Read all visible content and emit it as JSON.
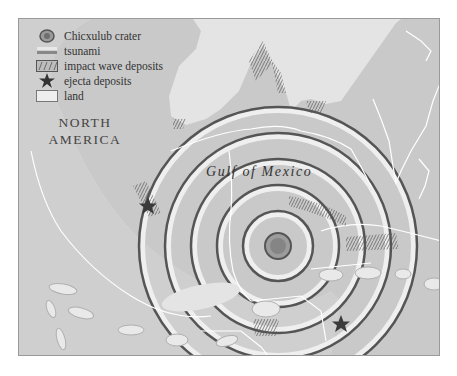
{
  "map": {
    "title_labels": {
      "continent": "NORTH AMERICA",
      "continent_line1": "NORTH",
      "continent_line2": "AMERICA",
      "sea": "Gulf of Mexico"
    },
    "legend": {
      "items": [
        {
          "icon": "crater-icon",
          "label": "Chicxulub crater"
        },
        {
          "icon": "tsunami-icon",
          "label": "tsunami"
        },
        {
          "icon": "impact-wave-deposits-icon",
          "label": "impact wave deposits"
        },
        {
          "icon": "star-icon",
          "label": "ejecta deposits"
        },
        {
          "icon": "land-icon",
          "label": "land"
        }
      ]
    },
    "colors": {
      "sea": "#c9c9c9",
      "land": "#e4e4e4",
      "ring_dark": "#555555",
      "ring_light": "#efefef",
      "coastline": "#ffffff",
      "crater": "#8a8a8a",
      "star": "#333333"
    },
    "crater_center": {
      "x": 277,
      "y": 245
    },
    "markers": [
      {
        "type": "ejecta",
        "x": 147,
        "y": 205
      },
      {
        "type": "ejecta",
        "x": 340,
        "y": 323
      }
    ]
  }
}
